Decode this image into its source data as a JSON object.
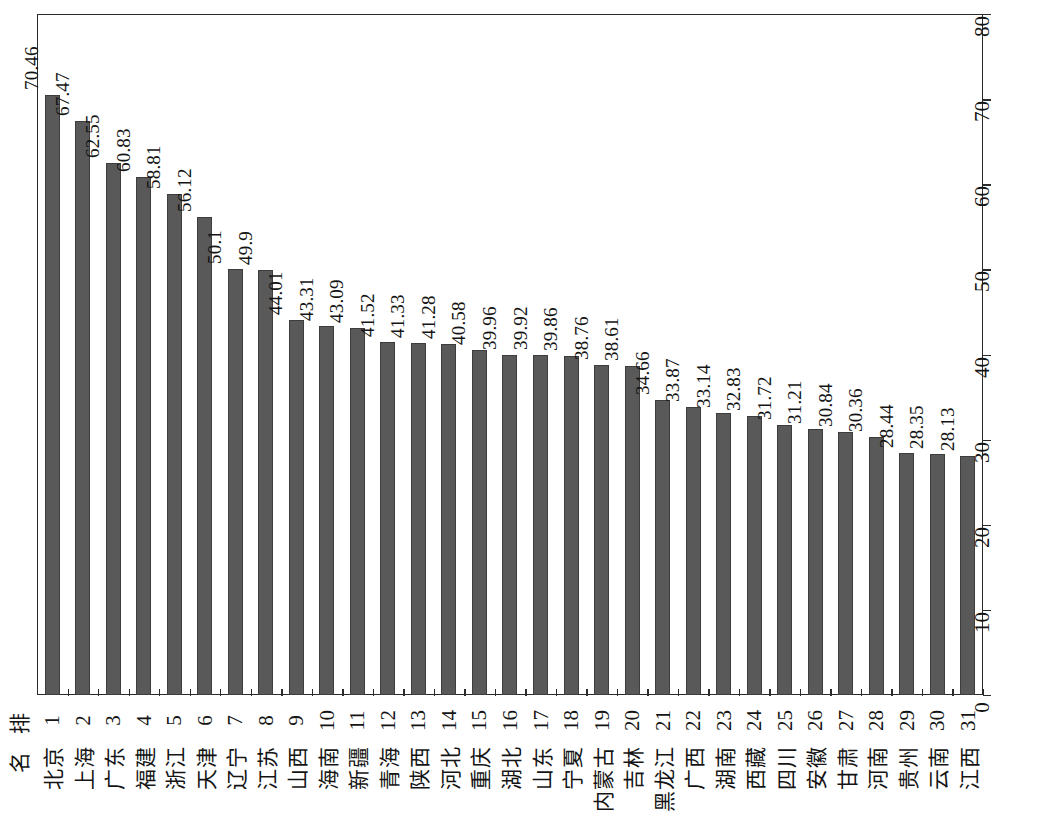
{
  "chart_data": {
    "type": "bar",
    "title": "",
    "orientation": "vertical-rotated",
    "xlabel": "排 名",
    "ylabel": "平均用户数（人/百人）",
    "ylim": [
      0,
      80
    ],
    "yticks": [
      0,
      10,
      20,
      30,
      40,
      50,
      60,
      70,
      80
    ],
    "grid": false,
    "legend": null,
    "bar_color": "#595959",
    "categories": [
      "北京",
      "上海",
      "广东",
      "福建",
      "浙江",
      "天津",
      "辽宁",
      "江苏",
      "山西",
      "海南",
      "新疆",
      "青海",
      "陕西",
      "河北",
      "重庆",
      "湖北",
      "山东",
      "宁夏",
      "内蒙古",
      "吉林",
      "黑龙江",
      "广西",
      "湖南",
      "西藏",
      "四川",
      "安徽",
      "甘肃",
      "河南",
      "贵州",
      "云南",
      "江西"
    ],
    "ranks": [
      "1",
      "2",
      "3",
      "4",
      "5",
      "6",
      "7",
      "8",
      "9",
      "10",
      "11",
      "12",
      "13",
      "14",
      "15",
      "16",
      "17",
      "18",
      "19",
      "20",
      "21",
      "22",
      "23",
      "24",
      "25",
      "26",
      "27",
      "28",
      "29",
      "30",
      "31"
    ],
    "values": [
      70.46,
      67.47,
      62.55,
      60.83,
      58.81,
      56.12,
      50.1,
      49.9,
      44.01,
      43.31,
      43.09,
      41.52,
      41.33,
      41.28,
      40.58,
      39.96,
      39.92,
      39.86,
      38.76,
      38.61,
      34.66,
      33.87,
      33.14,
      32.83,
      31.72,
      31.21,
      30.84,
      30.36,
      28.44,
      28.35,
      28.13
    ],
    "value_labels": [
      "70.46",
      "67.47",
      "62.55",
      "60.83",
      "58.81",
      "56.12",
      "50.1",
      "49.9",
      "44.01",
      "43.31",
      "43.09",
      "41.52",
      "41.33",
      "41.28",
      "40.58",
      "39.96",
      "39.92",
      "39.86",
      "38.76",
      "38.61",
      "34.66",
      "33.87",
      "33.14",
      "32.83",
      "31.72",
      "31.21",
      "30.84",
      "30.36",
      "28.44",
      "28.35",
      "28.13"
    ]
  },
  "axis_header": {
    "rank_label": "排",
    "region_label": "名"
  }
}
